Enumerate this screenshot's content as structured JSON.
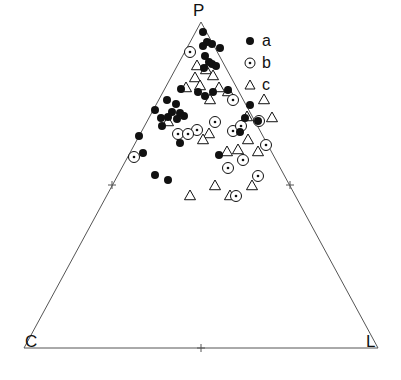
{
  "figure": {
    "type": "ternary-scatter",
    "vertices": [
      {
        "name": "apex-top",
        "label": "P",
        "x": 201,
        "y": 22
      },
      {
        "name": "apex-left",
        "label": "C",
        "x": 24,
        "y": 348
      },
      {
        "name": "apex-right",
        "label": "L",
        "x": 378,
        "y": 348
      }
    ],
    "axis_ticks": [
      {
        "edge": "left",
        "x": 112,
        "y": 185
      },
      {
        "edge": "right",
        "x": 290,
        "y": 185
      },
      {
        "edge": "bottom",
        "x": 201,
        "y": 348
      }
    ],
    "line_color": "#555555",
    "marker_color": "#111111"
  },
  "legend": {
    "items": [
      {
        "marker": "filled-circle",
        "label": "a"
      },
      {
        "marker": "dotted-circle",
        "label": "b"
      },
      {
        "marker": "open-triangle",
        "label": "c"
      }
    ]
  },
  "chart_data": {
    "type": "scatter",
    "title": "",
    "xlabel": "",
    "ylabel": "",
    "grid": false,
    "legend_position": "top-right",
    "axis_labels": [
      "P",
      "C",
      "L"
    ],
    "series": [
      {
        "name": "a",
        "marker": "filled-circle",
        "points": [
          [
            203,
            32
          ],
          [
            207,
            42
          ],
          [
            212,
            44
          ],
          [
            203,
            46
          ],
          [
            220,
            48
          ],
          [
            205,
            56
          ],
          [
            209,
            62
          ],
          [
            212,
            64
          ],
          [
            216,
            66
          ],
          [
            204,
            68
          ],
          [
            181,
            89
          ],
          [
            198,
            92
          ],
          [
            205,
            96
          ],
          [
            213,
            92
          ],
          [
            228,
            90
          ],
          [
            167,
            100
          ],
          [
            176,
            104
          ],
          [
            172,
            112
          ],
          [
            180,
            113
          ],
          [
            168,
            117
          ],
          [
            161,
            118
          ],
          [
            177,
            119
          ],
          [
            184,
            116
          ],
          [
            155,
            110
          ],
          [
            162,
            126
          ],
          [
            250,
            105
          ],
          [
            245,
            118
          ],
          [
            258,
            121
          ],
          [
            240,
            132
          ],
          [
            139,
            136
          ],
          [
            180,
            143
          ],
          [
            143,
            153
          ],
          [
            155,
            175
          ],
          [
            168,
            180
          ],
          [
            219,
            155
          ]
        ]
      },
      {
        "name": "b",
        "marker": "dotted-circle",
        "points": [
          [
            190,
            52
          ],
          [
            233,
            100
          ],
          [
            215,
            122
          ],
          [
            197,
            130
          ],
          [
            178,
            134
          ],
          [
            188,
            134
          ],
          [
            233,
            131
          ],
          [
            241,
            126
          ],
          [
            259,
            121
          ],
          [
            266,
            145
          ],
          [
            243,
            160
          ],
          [
            228,
            168
          ],
          [
            236,
            196
          ],
          [
            258,
            176
          ],
          [
            134,
            157
          ]
        ]
      },
      {
        "name": "c",
        "marker": "open-triangle",
        "points": [
          [
            197,
            66
          ],
          [
            206,
            70
          ],
          [
            195,
            78
          ],
          [
            213,
            76
          ],
          [
            186,
            88
          ],
          [
            200,
            86
          ],
          [
            219,
            88
          ],
          [
            228,
            92
          ],
          [
            210,
            100
          ],
          [
            264,
            100
          ],
          [
            247,
            117
          ],
          [
            272,
            118
          ],
          [
            168,
            122
          ],
          [
            209,
            134
          ],
          [
            203,
            140
          ],
          [
            248,
            140
          ],
          [
            238,
            150
          ],
          [
            227,
            152
          ],
          [
            258,
            152
          ],
          [
            215,
            186
          ],
          [
            252,
            186
          ],
          [
            190,
            196
          ],
          [
            230,
            196
          ]
        ]
      }
    ]
  }
}
